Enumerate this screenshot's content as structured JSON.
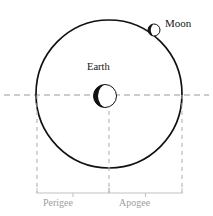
{
  "figure": {
    "type": "diagram",
    "background_color": "#ffffff",
    "width": 213,
    "height": 216
  },
  "labels": {
    "moon": "Moon",
    "earth": "Earth",
    "perigee": "Perigee",
    "apogee": "Apogee"
  },
  "colors": {
    "orbit_stroke": "#111111",
    "body_stroke": "#111111",
    "body_fill_dark": "#111111",
    "body_fill_light": "#ffffff",
    "dashed_line": "#9a9a9a",
    "bracket": "#bdbdbd",
    "label_dark": "#141414",
    "label_gray": "#9d9d9d"
  },
  "geometry": {
    "orbit": {
      "center_x": 109,
      "center_y": 94,
      "radius_x": 73,
      "radius_y": 74,
      "stroke_width": 1.6
    },
    "earth": {
      "center_x": 105,
      "center_y": 96,
      "radius": 11.5
    },
    "moon": {
      "center_x": 154,
      "center_y": 30,
      "radius": 6
    },
    "axis_line": {
      "y": 95,
      "x_start": 4,
      "x_end": 209
    },
    "drop_lines": {
      "left_x": 37,
      "center_x": 109,
      "right_x": 182,
      "y_top": 95,
      "y_bottom": 193
    },
    "brackets": {
      "y": 193,
      "tick_depth": 5,
      "perigee_span": [
        37,
        109
      ],
      "apogee_span": [
        109,
        182
      ]
    }
  }
}
